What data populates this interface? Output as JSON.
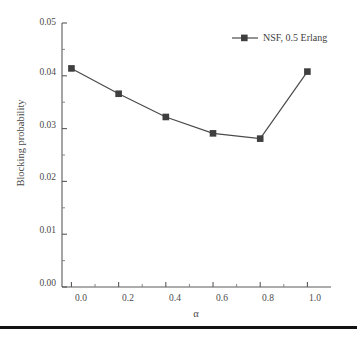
{
  "chart_data": {
    "type": "line",
    "title": "",
    "xlabel": "α",
    "ylabel": "Blocking probability",
    "xlim": [
      -0.04,
      1.1
    ],
    "ylim": [
      0.0,
      0.05
    ],
    "grid": false,
    "legend_position": "top-right",
    "x": [
      0.0,
      0.2,
      0.4,
      0.6,
      0.8,
      1.0
    ],
    "xtick_labels": [
      "0.0",
      "0.2",
      "0.4",
      "0.6",
      "0.8",
      "1.0"
    ],
    "ytick_labels": [
      "0.00",
      "0.01",
      "0.02",
      "0.03",
      "0.04",
      "0.05"
    ],
    "ytick_values": [
      0.0,
      0.01,
      0.02,
      0.03,
      0.04,
      0.05
    ],
    "minor_ticks": true,
    "series": [
      {
        "name": "NSF, 0.5 Erlang",
        "marker": "square",
        "color": "#4a4a4a",
        "values": [
          0.0414,
          0.0366,
          0.0322,
          0.0291,
          0.0281,
          0.0408
        ]
      }
    ]
  },
  "legend": {
    "entries": [
      {
        "label": "NSF, 0.5 Erlang",
        "color": "#4a4a4a",
        "marker": "square"
      }
    ]
  },
  "axes": {
    "x_title": "α",
    "y_title": "Blocking probability"
  },
  "decor": {
    "bottom_rule_color": "#121212"
  }
}
